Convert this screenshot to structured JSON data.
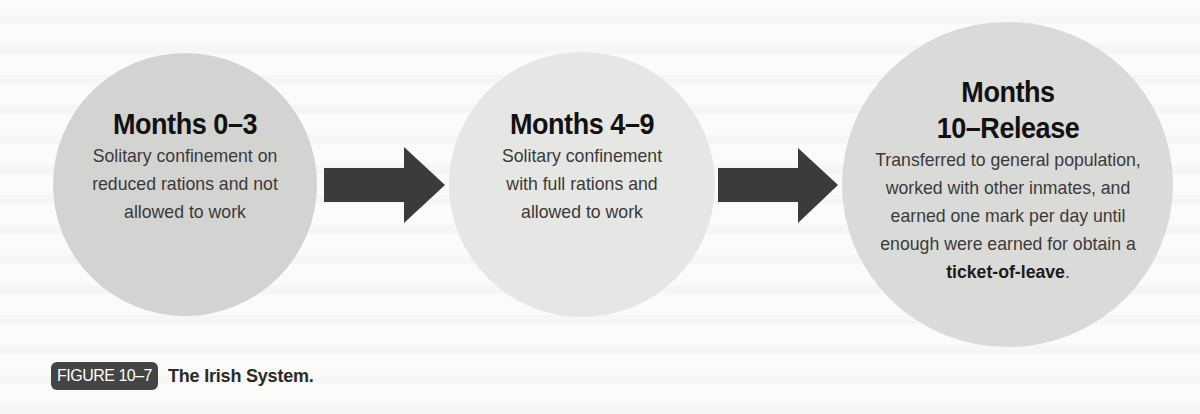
{
  "figure": {
    "label": "FIGURE 10–7",
    "title": "The Irish System."
  },
  "stages": [
    {
      "title_lines": [
        "Months 0–3"
      ],
      "description": "Solitary confinement on reduced rations and not allowed to work"
    },
    {
      "title_lines": [
        "Months 4–9"
      ],
      "description": "Solitary confinement with full rations and allowed to work"
    },
    {
      "title_lines": [
        "Months",
        "10–Release"
      ],
      "description": "Transferred to general population, worked with other inmates, and earned one mark per day until enough were earned for obtain a",
      "emphasis": "ticket-of-leave",
      "trailing": "."
    }
  ],
  "colors": {
    "circle_1": "#d3d3d1",
    "circle_2": "#e6e6e4",
    "circle_3": "#dadad8",
    "arrow": "#3b3b3b",
    "badge": "#444444"
  }
}
